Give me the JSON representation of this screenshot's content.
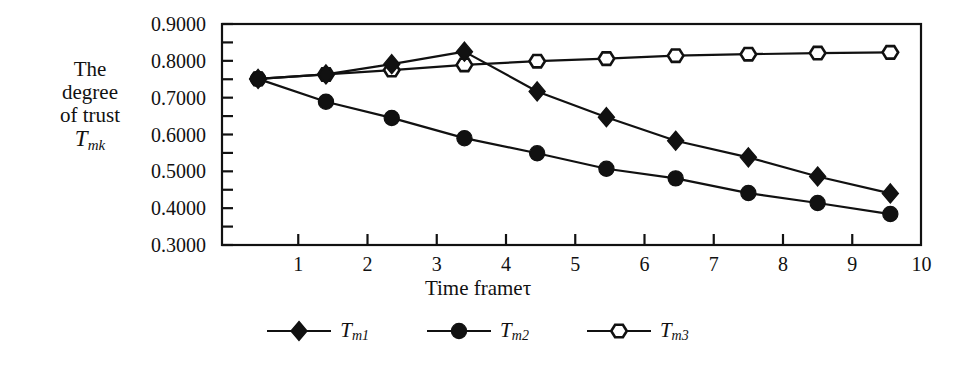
{
  "chart_data": {
    "type": "line",
    "title": "",
    "xlabel": "Time frameτ",
    "ylabel_lines": [
      "The",
      "degree",
      "of trust"
    ],
    "ylabel_symbol": "T",
    "ylabel_symbol_sub": "mk",
    "xlim": [
      0,
      10
    ],
    "ylim": [
      0.3,
      0.9
    ],
    "xticks": [
      1,
      2,
      3,
      4,
      5,
      6,
      7,
      8,
      9,
      10
    ],
    "xtick_labels": [
      "1",
      "2",
      "3",
      "4",
      "5",
      "6",
      "7",
      "8",
      "9",
      "10"
    ],
    "yticks": [
      0.3,
      0.4,
      0.5,
      0.6,
      0.7,
      0.8,
      0.9
    ],
    "ytick_labels": [
      "0.3000",
      "0.4000",
      "0.5000",
      "0.6000",
      "0.7000",
      "0.8000",
      "0.9000"
    ],
    "grid": false,
    "legend_position": "below",
    "frame": true,
    "line_color": "#111111",
    "x": [
      0.42,
      1.4,
      2.35,
      3.4,
      4.45,
      5.45,
      6.45,
      7.5,
      8.5,
      9.55
    ],
    "series": [
      {
        "name": "T_m1",
        "label": "T",
        "label_sub": "m1",
        "marker": "filled-diamond",
        "color": "#111111",
        "values": [
          0.751,
          0.763,
          0.791,
          0.825,
          0.717,
          0.647,
          0.583,
          0.538,
          0.486,
          0.44
        ]
      },
      {
        "name": "T_m2",
        "label": "T",
        "label_sub": "m2",
        "marker": "filled-circle",
        "color": "#111111",
        "values": [
          0.751,
          0.689,
          0.645,
          0.59,
          0.549,
          0.507,
          0.481,
          0.441,
          0.414,
          0.384
        ]
      },
      {
        "name": "T_m3",
        "label": "T",
        "label_sub": "m3",
        "marker": "open-hexagon",
        "color": "#111111",
        "values": [
          0.751,
          0.763,
          0.775,
          0.789,
          0.799,
          0.806,
          0.814,
          0.818,
          0.821,
          0.823
        ]
      }
    ]
  },
  "legend": {
    "items": [
      {
        "label": "T",
        "sub": "m1",
        "marker": "filled-diamond"
      },
      {
        "label": "T",
        "sub": "m2",
        "marker": "filled-circle"
      },
      {
        "label": "T",
        "sub": "m3",
        "marker": "open-hexagon"
      }
    ]
  }
}
